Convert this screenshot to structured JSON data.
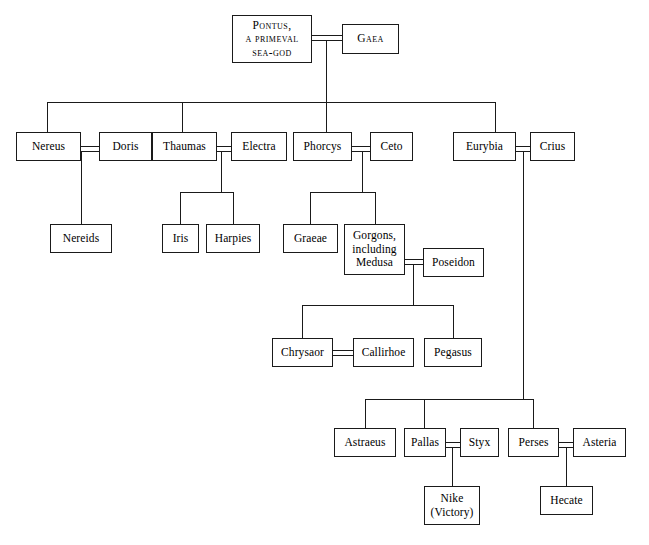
{
  "diagram": {
    "background_color": "#ffffff",
    "line_color": "#1a1a1a",
    "text_color": "#000000",
    "nodes": [
      {
        "id": "pontus",
        "label": "Pontus,\na primeval\nsea-god",
        "style": "smallcaps-first"
      },
      {
        "id": "gaea",
        "label": "Gaea",
        "style": "smallcaps"
      },
      {
        "id": "nereus",
        "label": "Nereus",
        "style": "normal"
      },
      {
        "id": "doris",
        "label": "Doris",
        "style": "normal"
      },
      {
        "id": "thaumas",
        "label": "Thaumas",
        "style": "normal"
      },
      {
        "id": "electra",
        "label": "Electra",
        "style": "normal"
      },
      {
        "id": "phorcys",
        "label": "Phorcys",
        "style": "normal"
      },
      {
        "id": "ceto",
        "label": "Ceto",
        "style": "normal"
      },
      {
        "id": "eurybia",
        "label": "Eurybia",
        "style": "normal"
      },
      {
        "id": "crius",
        "label": "Crius",
        "style": "normal"
      },
      {
        "id": "nereids",
        "label": "Nereids",
        "style": "normal"
      },
      {
        "id": "iris",
        "label": "Iris",
        "style": "normal"
      },
      {
        "id": "harpies",
        "label": "Harpies",
        "style": "normal"
      },
      {
        "id": "graeae",
        "label": "Graeae",
        "style": "normal"
      },
      {
        "id": "gorgons",
        "label": "Gorgons,\nincluding\nMedusa",
        "style": "normal"
      },
      {
        "id": "poseidon",
        "label": "Poseidon",
        "style": "normal"
      },
      {
        "id": "chrysaor",
        "label": "Chrysaor",
        "style": "normal"
      },
      {
        "id": "callirhoe",
        "label": "Callirhoe",
        "style": "normal"
      },
      {
        "id": "pegasus",
        "label": "Pegasus",
        "style": "normal"
      },
      {
        "id": "astraeus",
        "label": "Astraeus",
        "style": "normal"
      },
      {
        "id": "pallas",
        "label": "Pallas",
        "style": "normal"
      },
      {
        "id": "styx",
        "label": "Styx",
        "style": "normal"
      },
      {
        "id": "perses",
        "label": "Perses",
        "style": "normal"
      },
      {
        "id": "asteria",
        "label": "Asteria",
        "style": "normal"
      },
      {
        "id": "nike",
        "label": "Nike\n(Victory)",
        "style": "normal"
      },
      {
        "id": "hecate",
        "label": "Hecate",
        "style": "normal"
      }
    ],
    "marriages": [
      {
        "a": "pontus",
        "b": "gaea"
      },
      {
        "a": "nereus",
        "b": "doris"
      },
      {
        "a": "thaumas",
        "b": "electra"
      },
      {
        "a": "phorcys",
        "b": "ceto"
      },
      {
        "a": "eurybia",
        "b": "crius"
      },
      {
        "a": "gorgons",
        "b": "poseidon"
      },
      {
        "a": "chrysaor",
        "b": "callirhoe"
      },
      {
        "a": "pallas",
        "b": "styx"
      },
      {
        "a": "perses",
        "b": "asteria"
      }
    ],
    "descents": [
      {
        "parents": "pontus+gaea",
        "children": [
          "nereus",
          "thaumas",
          "phorcys",
          "eurybia"
        ]
      },
      {
        "parents": "nereus+doris",
        "children": [
          "nereids"
        ]
      },
      {
        "parents": "thaumas+electra",
        "children": [
          "iris",
          "harpies"
        ]
      },
      {
        "parents": "phorcys+ceto",
        "children": [
          "graeae",
          "gorgons"
        ]
      },
      {
        "parents": "gorgons+poseidon",
        "children": [
          "chrysaor",
          "pegasus"
        ]
      },
      {
        "parents": "eurybia+crius",
        "children": [
          "astraeus",
          "pallas",
          "perses"
        ]
      },
      {
        "parents": "pallas+styx",
        "children": [
          "nike"
        ]
      },
      {
        "parents": "perses+asteria",
        "children": [
          "hecate"
        ]
      }
    ]
  },
  "labels": {
    "pontus": "Pontus,\na primeval\nsea-god",
    "gaea": "Gaea",
    "nereus": "Nereus",
    "doris": "Doris",
    "thaumas": "Thaumas",
    "electra": "Electra",
    "phorcys": "Phorcys",
    "ceto": "Ceto",
    "eurybia": "Eurybia",
    "crius": "Crius",
    "nereids": "Nereids",
    "iris": "Iris",
    "harpies": "Harpies",
    "graeae": "Graeae",
    "gorgons": "Gorgons,\nincluding\nMedusa",
    "poseidon": "Poseidon",
    "chrysaor": "Chrysaor",
    "callirhoe": "Callirhoe",
    "pegasus": "Pegasus",
    "astraeus": "Astraeus",
    "pallas": "Pallas",
    "styx": "Styx",
    "perses": "Perses",
    "asteria": "Asteria",
    "nike": "Nike\n(Victory)",
    "hecate": "Hecate"
  }
}
